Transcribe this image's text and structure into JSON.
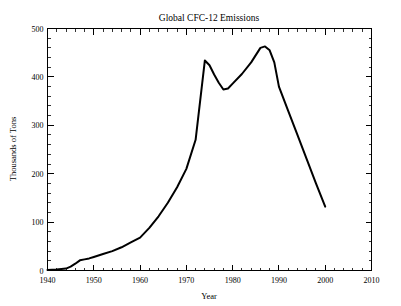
{
  "chart_data": {
    "type": "line",
    "title": "Global CFC-12 Emissions",
    "xlabel": "Year",
    "ylabel": "Thousands of Tons",
    "xlim": [
      1940,
      2010
    ],
    "ylim": [
      0,
      500
    ],
    "xticks": [
      1940,
      1950,
      1960,
      1970,
      1980,
      1990,
      2000,
      2010
    ],
    "yticks": [
      0,
      100,
      200,
      300,
      400,
      500
    ],
    "x_minor_interval": 2,
    "y_minor_interval": 20,
    "grid": false,
    "legend": null,
    "line_color": "#000000",
    "series": [
      {
        "name": "Global CFC-12 Emissions",
        "x": [
          1940,
          1942,
          1944,
          1945,
          1946,
          1947,
          1948,
          1949,
          1950,
          1952,
          1954,
          1956,
          1958,
          1960,
          1962,
          1964,
          1966,
          1968,
          1970,
          1972,
          1974,
          1975,
          1976,
          1977,
          1978,
          1979,
          1980,
          1982,
          1984,
          1986,
          1987,
          1988,
          1989,
          1990,
          1992,
          1994,
          1996,
          1998,
          2000
        ],
        "values": [
          1,
          2,
          4,
          8,
          14,
          21,
          23,
          25,
          28,
          34,
          40,
          48,
          58,
          68,
          88,
          112,
          140,
          172,
          210,
          270,
          434,
          424,
          405,
          388,
          374,
          376,
          386,
          406,
          430,
          460,
          463,
          455,
          430,
          380,
          330,
          280,
          230,
          180,
          132
        ]
      }
    ]
  },
  "axes": {
    "y_tick_labels": [
      "0",
      "100",
      "200",
      "300",
      "400",
      "500"
    ],
    "x_tick_labels": [
      "1940",
      "1950",
      "1960",
      "1970",
      "1980",
      "1990",
      "2000",
      "2010"
    ]
  }
}
